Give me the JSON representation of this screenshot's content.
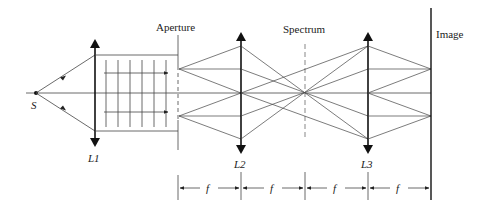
{
  "diagram": {
    "type": "4f optical spatial filtering system",
    "labels": {
      "source": "S",
      "lens1": "L1",
      "lens2": "L2",
      "lens3": "L3",
      "aperture": "Aperture",
      "spectrum": "Spectrum",
      "image": "Image",
      "focal": "f"
    },
    "dimensions": [
      "f",
      "f",
      "f",
      "f"
    ],
    "colors": {
      "line": "#333333",
      "background": "#ffffff"
    }
  }
}
